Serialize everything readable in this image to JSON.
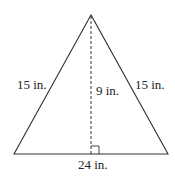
{
  "figure": {
    "type": "isosceles-triangle",
    "labels": {
      "left_side": "15 in.",
      "right_side": "15 in.",
      "height": "9 in.",
      "base": "24 in."
    },
    "colors": {
      "stroke": "#333333",
      "text": "#222222"
    }
  }
}
